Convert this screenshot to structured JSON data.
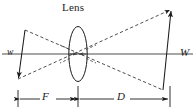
{
  "figure": {
    "type": "optical-ray-diagram",
    "width_px": 195,
    "height_px": 112,
    "background": "#ffffff"
  },
  "labels": {
    "lens": "Lens",
    "object_height": "w",
    "image_height": "W",
    "focal_distance": "F",
    "image_distance": "D"
  },
  "colors": {
    "axis": "#a6a6a6",
    "rays": "#3a3a3a",
    "outline": "#1b1b1b",
    "dimension": "#1b1b1b",
    "text": "#1b1b1b"
  },
  "geometry": {
    "optical_axis_y": 54,
    "lens_center_x": 78,
    "lens_center_y": 54,
    "lens_rx": 9,
    "lens_ry": 27,
    "object_top_x": 25,
    "object_top_y": 30,
    "object_bottom_x": 18,
    "object_bottom_y": 79,
    "image_top_x": 171,
    "image_top_y": 10,
    "image_bottom_x": 163,
    "image_bottom_y": 90,
    "dim_line_y": 99,
    "dim_tick_left_x": 18,
    "dim_tick_mid_x": 78,
    "dim_tick_right_x": 170
  },
  "rays": [
    {
      "name": "ray-object-top-to-image-bottom",
      "style": "dashed",
      "from": [
        25,
        30
      ],
      "to": [
        163,
        90
      ]
    },
    {
      "name": "ray-object-bottom-to-image-top",
      "style": "dashed",
      "from": [
        18,
        79
      ],
      "to": [
        171,
        10
      ]
    },
    {
      "name": "ray-chief-through-center",
      "style": "dashed",
      "from": [
        25,
        30
      ],
      "to": [
        78,
        54
      ]
    }
  ],
  "dimensions": [
    {
      "name": "focal-distance",
      "label": "F",
      "start_x": 18,
      "end_x": 78
    },
    {
      "name": "image-distance",
      "label": "D",
      "start_x": 78,
      "end_x": 170
    }
  ]
}
